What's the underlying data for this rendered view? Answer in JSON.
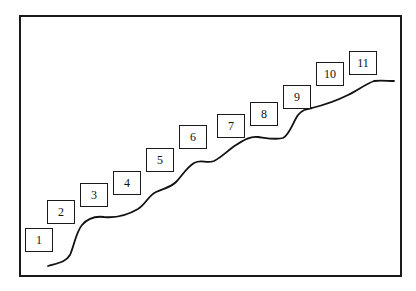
{
  "diagram": {
    "type": "staircase-progression",
    "frame": {
      "x": 19,
      "y": 15,
      "width": 379,
      "height": 258,
      "border_color": "#1a1a1a"
    },
    "steps": [
      {
        "label": "1",
        "x": 25,
        "y": 228
      },
      {
        "label": "2",
        "x": 47,
        "y": 200
      },
      {
        "label": "3",
        "x": 80,
        "y": 183
      },
      {
        "label": "4",
        "x": 113,
        "y": 171
      },
      {
        "label": "5",
        "x": 146,
        "y": 148
      },
      {
        "label": "6",
        "x": 179,
        "y": 125
      },
      {
        "label": "7",
        "x": 217,
        "y": 114
      },
      {
        "label": "8",
        "x": 250,
        "y": 102
      },
      {
        "label": "9",
        "x": 283,
        "y": 85
      },
      {
        "label": "10",
        "x": 316,
        "y": 62
      },
      {
        "label": "11",
        "x": 349,
        "y": 51
      }
    ],
    "curve": {
      "description": "wavy rising line beneath the numbered boxes",
      "stroke": "#111111",
      "stroke_width": 1.8,
      "path": "M48,266 C58,263 66,262 70,255 C74,246 76,232 82,225 C88,218 96,216 104,217 C114,218 126,216 138,209 C146,204 148,196 156,192 C164,188 170,188 176,182 C182,176 186,168 194,163 C202,159 206,164 214,161 C222,157 228,150 236,145 C244,140 250,136 258,137 C266,138 276,140 283,138 C290,134 292,124 298,115 C302,110 306,109 312,108 C324,105 336,101 348,95 C358,90 366,84 374,81 C380,80 388,81 394,81"
    }
  }
}
